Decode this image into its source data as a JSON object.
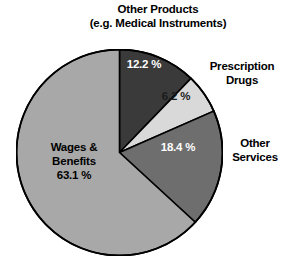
{
  "header": {
    "title_line1": "Other Products",
    "title_line2": "(e.g. Medical Instruments)"
  },
  "labels": {
    "prescription_line1": "Prescription",
    "prescription_line2": "Drugs",
    "other_services_line1": "Other",
    "other_services_line2": "Services",
    "wages_line1": "Wages &",
    "wages_line2": "Benefits",
    "wages_value": "63.1 %"
  },
  "values": {
    "other_products": "12.2 %",
    "prescription_drugs": "6.2 %",
    "other_services": "18.4 %",
    "wages_benefits": "63.1 %"
  },
  "colors": {
    "other_products": "#3a3a3a",
    "prescription_drugs": "#d9d9d9",
    "other_services": "#6e6e6e",
    "wages_benefits": "#a8a8a8",
    "outline": "#000000",
    "background": "#ffffff"
  },
  "chart_data": {
    "type": "pie",
    "title": "Other Products (e.g. Medical Instruments)",
    "xlabel": "",
    "ylabel": "",
    "legend_position": "outside-labels",
    "grid": false,
    "start_angle_deg": 0,
    "direction": "clockwise",
    "unit": "%",
    "categories": [
      "Other Products (e.g. Medical Instruments)",
      "Prescription Drugs",
      "Other Services",
      "Wages & Benefits"
    ],
    "values": [
      12.2,
      6.2,
      18.4,
      63.1
    ],
    "data_labels": [
      "12.2 %",
      "6.2 %",
      "18.4 %",
      "63.1 %"
    ],
    "slice_colors": [
      "#3a3a3a",
      "#d9d9d9",
      "#6e6e6e",
      "#a8a8a8"
    ],
    "label_text_colors": [
      "#ffffff",
      "#1a1a1a",
      "#ffffff",
      "#000000"
    ],
    "total": 99.9
  }
}
